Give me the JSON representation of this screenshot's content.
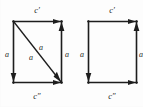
{
  "figure": {
    "ink_color": "#1d1d1d",
    "background_color": "#fdfdfd",
    "squares": [
      {
        "id": "left-square",
        "has_diagonal": true,
        "labels": {
          "top": "c′",
          "bottom": "c″",
          "left": "a",
          "right": "a",
          "diagonal_upper": "a",
          "diagonal_lower": "a"
        },
        "arrows": {
          "top": "right",
          "bottom": "right",
          "left": "down",
          "right": "up",
          "diagonal": "down-right"
        }
      },
      {
        "id": "right-square",
        "has_diagonal": false,
        "labels": {
          "top": "c′",
          "bottom": "c″",
          "left": "a",
          "right": "a"
        },
        "arrows": {
          "top": "right",
          "bottom": "right",
          "left": "down",
          "right": "up"
        }
      }
    ]
  }
}
